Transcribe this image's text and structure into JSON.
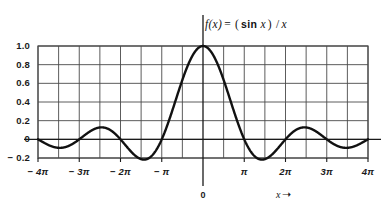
{
  "title": {
    "fn_name": "f(x)",
    "equals": "=",
    "expr_open": "(",
    "sin_text": "sin",
    "var_text": "x",
    "expr_close": ")",
    "divider": "/",
    "denominator": "x",
    "full": "f(x) = (sin x)/x"
  },
  "axis_caption": {
    "label": "x",
    "arrow": "➝"
  },
  "origin": {
    "label": "0"
  },
  "colors": {
    "curve": "#111111",
    "grid": "#4a4a4a",
    "axis": "#1a1a1a",
    "background": "#ffffff",
    "text": "#1b1b1b"
  },
  "chart_data": {
    "type": "line",
    "xlabel": "x",
    "ylabel": "",
    "xlim": [
      -12.566370614,
      12.566370614
    ],
    "ylim": [
      -0.2,
      1.0
    ],
    "grid": true,
    "legend": null,
    "x_tick_labels": [
      "− 4π",
      "− 3π",
      "− 2π",
      "− π",
      "π",
      "2π",
      "3π",
      "4π"
    ],
    "x_tick_values": [
      -12.566370614,
      -9.424777961,
      -6.283185307,
      -3.141592654,
      3.141592654,
      6.283185307,
      9.424777961,
      12.566370614
    ],
    "y_tick_labels": [
      "1.0",
      "0.8",
      "0.6",
      "0.4",
      "0.2",
      "0",
      "− 0.2"
    ],
    "y_tick_values": [
      1.0,
      0.8,
      0.6,
      0.4,
      0.2,
      0.0,
      -0.2
    ],
    "gridline_x_step_label": "π/2",
    "series": [
      {
        "name": "sinc",
        "formula": "sin(x)/x",
        "key_points": [
          {
            "x": -12.566370614,
            "y": 0.0
          },
          {
            "x": -10.904121587,
            "y": 0.0913
          },
          {
            "x": -9.424777961,
            "y": 0.0
          },
          {
            "x": -7.725251837,
            "y": -0.1284
          },
          {
            "x": -6.283185307,
            "y": 0.0
          },
          {
            "x": -4.493409458,
            "y": -0.2172
          },
          {
            "x": -3.141592654,
            "y": 0.0
          },
          {
            "x": 0.0,
            "y": 1.0
          },
          {
            "x": 3.141592654,
            "y": 0.0
          },
          {
            "x": 4.493409458,
            "y": -0.2172
          },
          {
            "x": 6.283185307,
            "y": 0.0
          },
          {
            "x": 7.725251837,
            "y": -0.1284
          },
          {
            "x": 9.424777961,
            "y": 0.0
          },
          {
            "x": 10.904121587,
            "y": 0.0913
          },
          {
            "x": 12.566370614,
            "y": 0.0
          }
        ]
      }
    ]
  }
}
